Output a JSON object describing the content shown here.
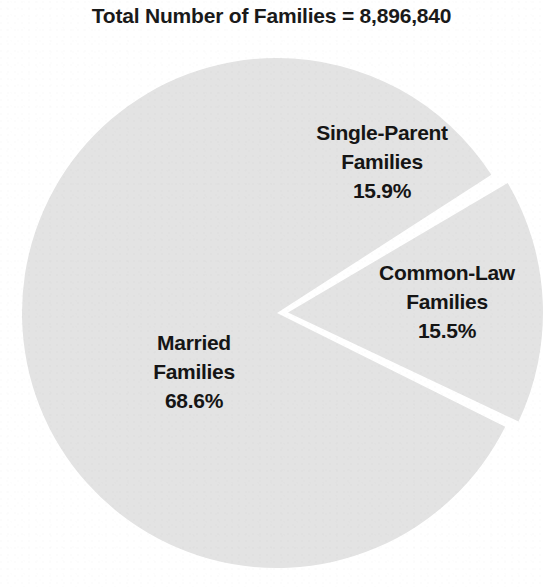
{
  "chart_data": {
    "type": "pie",
    "title": "Total Number of Families = 8,896,840",
    "total_label": "Total Number of Families",
    "total_value": "8,896,840",
    "xlabel": "",
    "ylabel": "",
    "legend": "none",
    "grid": false,
    "categories": [
      "Married Families",
      "Single-Parent Families",
      "Common-Law Families"
    ],
    "values": [
      68.6,
      15.9,
      15.5
    ],
    "value_unit": "%",
    "slice_fill_color": "#e3e3e3",
    "slice_separator_color": "#ffffff",
    "text_color": "#151515",
    "background_color": "#ffffff",
    "slices": [
      {
        "id": "married",
        "name_line1": "Married",
        "name_line2": "Families",
        "percent_label": "68.6%",
        "value": 68.6,
        "start_angle_deg": 116.5,
        "end_angle_deg": 360.0,
        "exploded": false,
        "fill": "#e3e3e3"
      },
      {
        "id": "single-parent",
        "name_line1": "Single-Parent",
        "name_line2": "Families",
        "percent_label": "15.9%",
        "value": 15.9,
        "start_angle_deg": 0.0,
        "end_angle_deg": 57.2,
        "exploded": false,
        "fill": "#e3e3e3"
      },
      {
        "id": "common-law",
        "name_line1": "Common-Law",
        "name_line2": "Families",
        "percent_label": "15.5%",
        "value": 15.5,
        "start_angle_deg": 59.5,
        "end_angle_deg": 115.3,
        "exploded": true,
        "fill": "#e3e3e3"
      }
    ],
    "geometry": {
      "center_x": 277,
      "center_y": 313,
      "radius": 255,
      "explode_offset": 11
    }
  },
  "labels": {
    "single_parent": {
      "line1": "Single-Parent",
      "line2": "Families",
      "percent": "15.9%"
    },
    "common_law": {
      "line1": "Common-Law",
      "line2": "Families",
      "percent": "15.5%"
    },
    "married": {
      "line1": "Married",
      "line2": "Families",
      "percent": "68.6%"
    }
  }
}
